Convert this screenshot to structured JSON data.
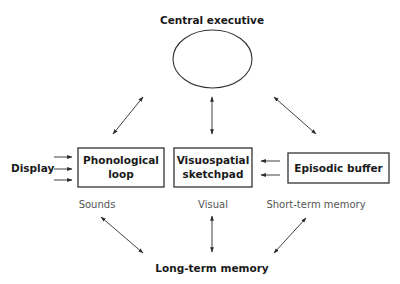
{
  "diagram": {
    "nodes": {
      "central_executive": {
        "label": "Central executive",
        "shape": "ellipse"
      },
      "phonological_loop": {
        "label_line1": "Phonological",
        "label_line2": "loop",
        "shape": "rect"
      },
      "visuospatial_sketchpad": {
        "label_line1": "Visuospatial",
        "label_line2": "sketchpad",
        "shape": "rect"
      },
      "episodic_buffer": {
        "label": "Episodic buffer",
        "shape": "rect"
      },
      "display": {
        "label": "Display"
      },
      "long_term_memory": {
        "label": "Long-term memory"
      }
    },
    "sublabels": {
      "sounds": "Sounds",
      "visual": "Visual",
      "short_term_memory": "Short-term memory"
    },
    "edges": [
      {
        "from": "central_executive",
        "to": "phonological_loop",
        "type": "bidirectional"
      },
      {
        "from": "central_executive",
        "to": "visuospatial_sketchpad",
        "type": "bidirectional"
      },
      {
        "from": "central_executive",
        "to": "episodic_buffer",
        "type": "bidirectional"
      },
      {
        "from": "display",
        "to": "phonological_loop",
        "type": "directed",
        "count": 3
      },
      {
        "from": "episodic_buffer",
        "to": "visuospatial_sketchpad",
        "type": "directed",
        "count": 2
      },
      {
        "from": "phonological_loop",
        "to": "long_term_memory",
        "type": "bidirectional"
      },
      {
        "from": "visuospatial_sketchpad",
        "to": "long_term_memory",
        "type": "bidirectional"
      },
      {
        "from": "episodic_buffer",
        "to": "long_term_memory",
        "type": "bidirectional"
      }
    ],
    "colors": {
      "stroke": "#333333",
      "text": "#1a1a1a",
      "sublabel_text": "#555555",
      "background": "#ffffff"
    }
  }
}
